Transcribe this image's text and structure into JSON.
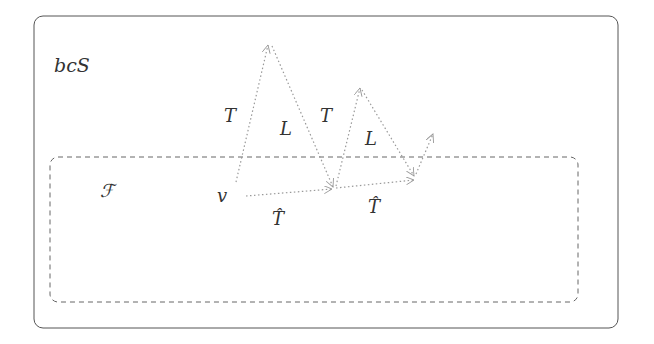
{
  "diagram": {
    "outer_label": "bcS",
    "inner_label": "ℱ",
    "start_label": "v",
    "edge_labels": {
      "t1": "T",
      "l1": "L",
      "t2": "T",
      "l2": "L",
      "that1": "T̂",
      "that2": "T̂"
    },
    "colors": {
      "outer_border": "#555555",
      "inner_border": "#666666",
      "arrows": "#999999",
      "text": "#333333"
    }
  }
}
